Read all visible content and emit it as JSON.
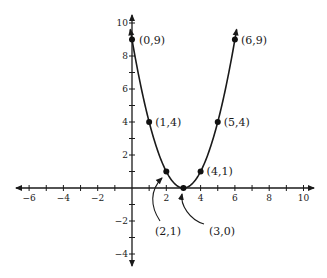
{
  "chart_data": {
    "type": "line",
    "title": "",
    "xlabel": "",
    "ylabel": "",
    "function": "y = (x-3)^2",
    "xlim": [
      -6.5,
      10.5
    ],
    "ylim": [
      -4.5,
      10.5
    ],
    "grid": false,
    "x_tick_labels": [
      "-6",
      "-4",
      "-2",
      "2",
      "4",
      "6",
      "8",
      "10"
    ],
    "y_tick_labels": [
      "10",
      "8",
      "6",
      "4",
      "2",
      "-2",
      "-4"
    ],
    "points": [
      {
        "x": 0,
        "y": 9,
        "label": "(0,9)"
      },
      {
        "x": 1,
        "y": 4,
        "label": "(1,4)"
      },
      {
        "x": 2,
        "y": 1,
        "label": "(2,1)"
      },
      {
        "x": 3,
        "y": 0,
        "label": "(3,0)"
      },
      {
        "x": 4,
        "y": 1,
        "label": "(4,1)"
      },
      {
        "x": 5,
        "y": 4,
        "label": "(5,4)"
      },
      {
        "x": 6,
        "y": 9,
        "label": "(6,9)"
      }
    ],
    "series": [
      {
        "name": "parabola",
        "x": [
          0,
          1,
          2,
          3,
          4,
          5,
          6
        ],
        "values": [
          9,
          4,
          1,
          0,
          1,
          4,
          9
        ]
      }
    ],
    "annotations": [
      "(2,1) with curved arrow",
      "(3,0) with curved arrow"
    ]
  }
}
